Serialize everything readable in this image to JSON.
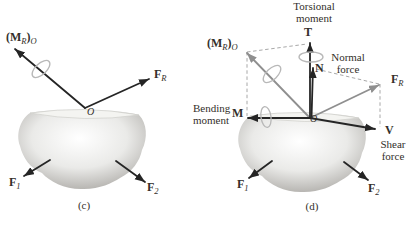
{
  "colors": {
    "arrow_black": "#252525",
    "arrow_gray": "#8f8f8f",
    "curl_gray": "#b8b8b8",
    "dashed_gray": "#9e9e9e",
    "text": "#332f2a",
    "body_light": "#ffffff",
    "body_mid": "#eaeae8",
    "body_dark": "#b0aeaa"
  },
  "panel_c": {
    "caption": "(c)",
    "origin_label": "O",
    "resultant_moment": {
      "open": "(",
      "m": "M",
      "r": "R",
      "close": ")",
      "o": "O"
    },
    "resultant_force": {
      "f": "F",
      "sub": "R"
    },
    "force_1": {
      "f": "F",
      "sub": "1"
    },
    "force_2": {
      "f": "F",
      "sub": "2"
    }
  },
  "panel_d": {
    "caption": "(d)",
    "origin_label": "O",
    "resultant_moment": {
      "open": "(",
      "m": "M",
      "r": "R",
      "close": ")",
      "o": "O"
    },
    "resultant_force": {
      "f": "F",
      "sub": "R"
    },
    "force_1": {
      "f": "F",
      "sub": "1"
    },
    "force_2": {
      "f": "F",
      "sub": "2"
    },
    "torsional_moment": {
      "line1": "Torsional",
      "line2": "moment",
      "vector": "T"
    },
    "normal_force": {
      "line1": "Normal",
      "line2": "force",
      "vector": "N"
    },
    "bending_moment": {
      "line1": "Bending",
      "line2": "moment",
      "vector": "M"
    },
    "shear_force": {
      "line1": "Shear",
      "line2": "force",
      "vector": "V"
    }
  }
}
